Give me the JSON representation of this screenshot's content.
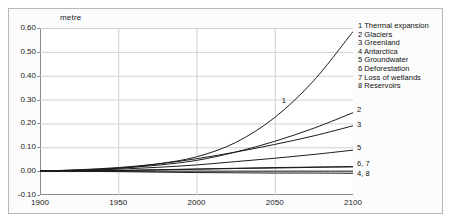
{
  "chart_data": {
    "type": "line",
    "title": "",
    "xlabel": "",
    "ylabel": "metre",
    "xlim": [
      1900,
      2100
    ],
    "ylim": [
      -0.1,
      0.6
    ],
    "grid": true,
    "legend_position": "right-outside",
    "xticks": [
      "1900",
      "1950",
      "2000",
      "2050",
      "2100"
    ],
    "yticks": [
      "0.60",
      "0.50",
      "0.40",
      "0.30",
      "0.20",
      "0.10",
      "0.00",
      "-0.10"
    ],
    "x": [
      1900,
      1925,
      1950,
      1975,
      2000,
      2025,
      2050,
      2075,
      2100
    ],
    "series": [
      {
        "name": "Thermal expansion",
        "key": "1",
        "end_label": "1",
        "values": [
          0.0,
          0.004,
          0.012,
          0.03,
          0.06,
          0.12,
          0.225,
          0.38,
          0.585
        ]
      },
      {
        "name": "Glaciers",
        "key": "2",
        "end_label": "2",
        "values": [
          0.0,
          0.005,
          0.012,
          0.025,
          0.045,
          0.08,
          0.125,
          0.18,
          0.245
        ]
      },
      {
        "name": "Greenland",
        "key": "3",
        "end_label": "3",
        "values": [
          0.0,
          0.006,
          0.015,
          0.03,
          0.052,
          0.08,
          0.112,
          0.148,
          0.19
        ]
      },
      {
        "name": "Antarctica",
        "key": "4",
        "end_label": "4, 8",
        "values": [
          0.0,
          0.0,
          0.0,
          0.0,
          0.0,
          0.0,
          0.0,
          0.0,
          0.0
        ]
      },
      {
        "name": "Groundwater",
        "key": "5",
        "end_label": "5",
        "values": [
          0.0,
          0.003,
          0.008,
          0.016,
          0.026,
          0.04,
          0.054,
          0.07,
          0.088
        ]
      },
      {
        "name": "Deforestation",
        "key": "6",
        "end_label": "6, 7",
        "values": [
          0.0,
          0.001,
          0.003,
          0.006,
          0.009,
          0.012,
          0.015,
          0.017,
          0.019
        ]
      },
      {
        "name": "Loss of wetlands",
        "key": "7",
        "end_label": "6, 7",
        "values": [
          0.0,
          0.001,
          0.002,
          0.005,
          0.008,
          0.011,
          0.013,
          0.016,
          0.018
        ]
      },
      {
        "name": "Reservoirs",
        "key": "8",
        "end_label": "4, 8",
        "values": [
          0.0,
          -0.001,
          -0.002,
          -0.004,
          -0.006,
          -0.007,
          -0.008,
          -0.008,
          -0.009
        ]
      }
    ],
    "legend_entries": [
      "1 Thermal expansion",
      "2 Glaciers",
      "3 Greenland",
      "4 Antarctica",
      "5 Groundwater",
      "6 Deforestation",
      "7 Loss of wetlands",
      "8 Reservoirs"
    ],
    "inline_annotations": [
      {
        "text": "1",
        "x": 2057,
        "y": 0.295
      },
      {
        "text": "2",
        "x": 2100,
        "y": 0.255
      },
      {
        "text": "3",
        "x": 2100,
        "y": 0.195
      },
      {
        "text": "5",
        "x": 2100,
        "y": 0.095
      },
      {
        "text": "6, 7",
        "x": 2100,
        "y": 0.03
      },
      {
        "text": "4, 8",
        "x": 2100,
        "y": -0.012
      }
    ],
    "colors": {
      "line": "#1c1c1c",
      "grid": "#cfcfcf",
      "axis": "#8c8c8c",
      "frame": "#b9b9b9"
    }
  }
}
